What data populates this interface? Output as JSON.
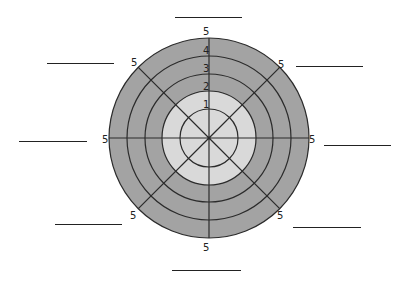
{
  "diagram": {
    "type": "wheel",
    "center": [
      209,
      138
    ],
    "colors": {
      "outer_ring": "#a3a3a3",
      "inner_disc": "#d9d9d9",
      "lines": "#2b2b2b",
      "background": "#ffffff"
    },
    "rings": [
      {
        "value": "1",
        "radius": 29
      },
      {
        "value": "2",
        "radius": 47
      },
      {
        "value": "3",
        "radius": 64
      },
      {
        "value": "4",
        "radius": 82
      },
      {
        "value": "5",
        "radius": 100
      }
    ],
    "scale_labels": [
      "1",
      "2",
      "3",
      "4",
      "5"
    ],
    "spokes": 8,
    "spoke_end_labels": [
      "5",
      "5",
      "5",
      "5",
      "5",
      "5",
      "5",
      "5"
    ],
    "blank_label_lines": [
      {
        "position": "top",
        "text": ""
      },
      {
        "position": "top-right",
        "text": ""
      },
      {
        "position": "right",
        "text": ""
      },
      {
        "position": "bottom-right",
        "text": ""
      },
      {
        "position": "bottom",
        "text": ""
      },
      {
        "position": "bottom-left",
        "text": ""
      },
      {
        "position": "left",
        "text": ""
      },
      {
        "position": "top-left",
        "text": ""
      }
    ]
  }
}
